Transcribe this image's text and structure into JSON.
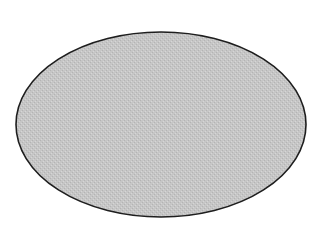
{
  "diagram": {
    "shape": "ellipse",
    "center": {
      "x": 161,
      "y": 124.5
    },
    "radius": {
      "x": 145,
      "y": 92.5
    },
    "fill_color": "#c6c6c6",
    "stroke_color": "#1e1e1e",
    "stroke_width": 1.6,
    "background_color": "#ffffff",
    "texture": "stippled-halftone"
  }
}
